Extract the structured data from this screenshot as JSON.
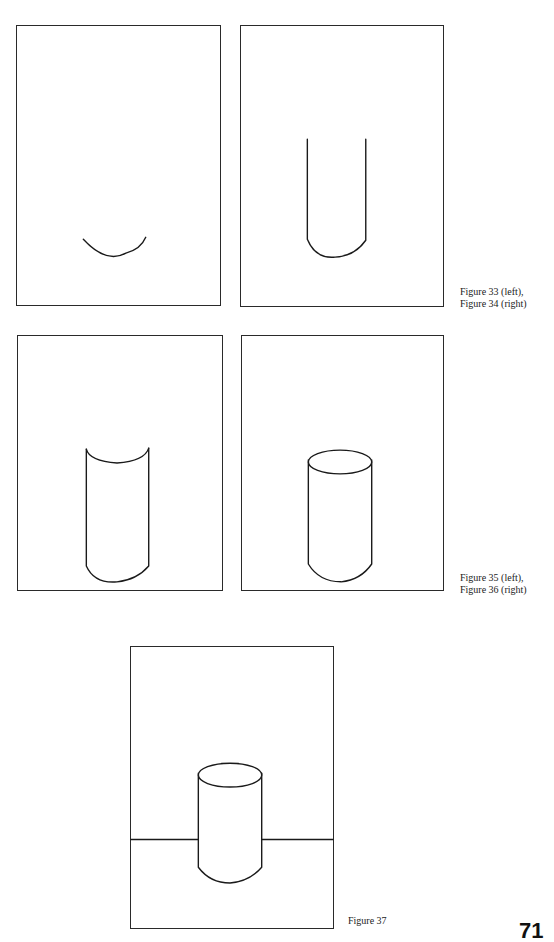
{
  "figures": [
    {
      "id": "33",
      "description": "Bottom curve of cylinder base"
    },
    {
      "id": "34",
      "description": "Base curve with vertical side lines"
    },
    {
      "id": "35",
      "description": "Cylinder sides with top back curve"
    },
    {
      "id": "36",
      "description": "Complete cylinder with elliptical top"
    },
    {
      "id": "37",
      "description": "Cylinder standing on a horizon line"
    }
  ],
  "captions": {
    "row1_line1": "Figure 33 (left),",
    "row1_line2": "Figure 34 (right)",
    "row2_line1": "Figure 35 (left),",
    "row2_line2": "Figure 36 (right)",
    "row3": "Figure 37"
  },
  "page_number": "71"
}
